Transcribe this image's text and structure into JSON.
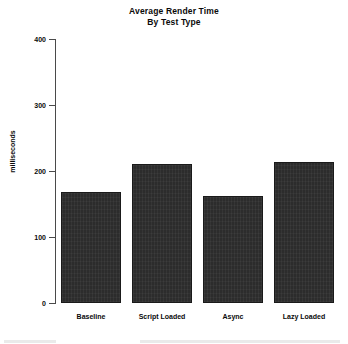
{
  "chart_data": {
    "type": "bar",
    "title": "Average Render Time\nBy Test Type",
    "title_line1": "Average Render Time",
    "title_line2": "By Test Type",
    "xlabel": "",
    "ylabel": "milliseconds",
    "categories": [
      "Baseline",
      "Script Loaded",
      "Async",
      "Lazy Loaded"
    ],
    "values": [
      168,
      211,
      162,
      213
    ],
    "ylim": [
      0,
      400
    ],
    "yticks": [
      0,
      100,
      200,
      300,
      400
    ],
    "ytick_labels": [
      "0",
      "100",
      "200",
      "300",
      "400"
    ],
    "grid": false,
    "legend": false,
    "bar_color": "#2c2c2c",
    "axis_color": "#4a4a4a",
    "background_color": "#ffffff"
  },
  "axis": {
    "y_title": "milliseconds"
  }
}
